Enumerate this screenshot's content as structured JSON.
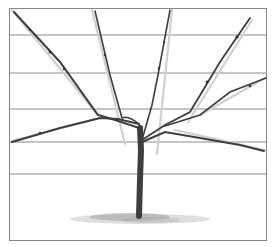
{
  "figure": {
    "frame": {
      "x": 9,
      "y": 8,
      "width": 257,
      "height": 232,
      "stroke": "#888888"
    },
    "wires": {
      "stroke": "#8a8a8a",
      "y_positions": [
        35,
        73,
        109,
        142,
        174
      ]
    },
    "colors": {
      "background": "#ffffff",
      "branch_dark": "#3a3a3a",
      "branch_mid": "#6a6a6a",
      "branch_light": "#c8c8c8",
      "ground": "#9a9a9a"
    }
  }
}
